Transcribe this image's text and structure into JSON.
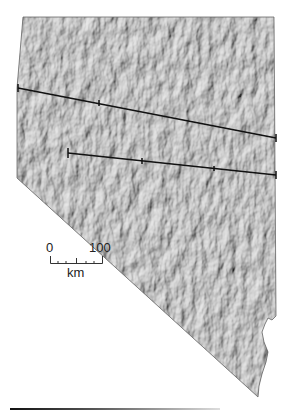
{
  "map": {
    "subject": "Shaded relief map",
    "region_shape": "Nevada outline",
    "colors": {
      "relief_base": "#b4b4b4",
      "relief_dark": "#5a5a5a",
      "relief_light": "#e6e6e6",
      "transect_line": "#111111",
      "background": "#ffffff"
    },
    "transects": [
      {
        "name": "northern-transect",
        "from": [
          18,
          88
        ],
        "to": [
          276,
          138
        ],
        "ticks": [
          [
            99,
            103
          ],
          [
            276,
            138
          ]
        ]
      },
      {
        "name": "southern-transect",
        "from": [
          68,
          153
        ],
        "to": [
          276,
          175
        ],
        "ticks": [
          [
            68,
            153
          ],
          [
            142,
            170
          ],
          [
            214,
            186
          ]
        ]
      }
    ]
  },
  "scale_bar": {
    "start_label": "0",
    "end_label": "100",
    "unit_label": "km"
  }
}
